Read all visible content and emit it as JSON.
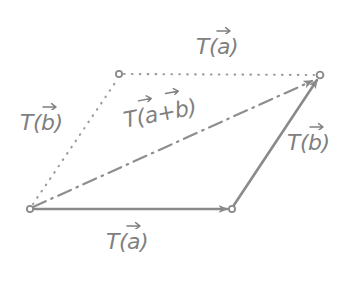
{
  "figure": {
    "background_color": "#ffffff",
    "stroke_color": "#8a8a8a",
    "label_color": "#808080",
    "vertex_marker": "small-open-circle"
  },
  "labels": {
    "top": {
      "name": "T(a) top",
      "base": "T(",
      "arg": "a",
      "close": ")",
      "accent": "right-arrow-overbar"
    },
    "left": {
      "name": "T(b) left",
      "base": "T(",
      "arg": "b",
      "close": ")",
      "accent": "right-arrow-overbar"
    },
    "middle": {
      "name": "T(a+b) diagonal",
      "base": "T(",
      "arg1": "a",
      "plus": "+",
      "arg2": "b",
      "close": ")",
      "accent": "right-arrow-overbar"
    },
    "right": {
      "name": "T(b) right",
      "base": "T(",
      "arg": "b",
      "close": ")",
      "accent": "right-arrow-overbar"
    },
    "bottom": {
      "name": "T(a) bottom",
      "base": "T(",
      "arg": "a",
      "close": ")",
      "accent": "right-arrow-overbar"
    }
  },
  "geometry": {
    "origin": {
      "x": 30,
      "y": 209
    },
    "bottom_right": {
      "x": 232,
      "y": 209
    },
    "top_right": {
      "x": 320,
      "y": 75
    },
    "top_left": {
      "x": 119,
      "y": 74
    },
    "edges": [
      {
        "name": "bottom-edge-Ta",
        "style": "solid",
        "arrowhead": true
      },
      {
        "name": "right-edge-Tb",
        "style": "solid",
        "arrowhead": true
      },
      {
        "name": "top-edge-Ta",
        "style": "dotted",
        "arrowhead": false
      },
      {
        "name": "left-edge-Tb",
        "style": "dotted",
        "arrowhead": false
      },
      {
        "name": "diagonal-Tab",
        "style": "dash-dot",
        "arrowhead": true
      }
    ]
  }
}
